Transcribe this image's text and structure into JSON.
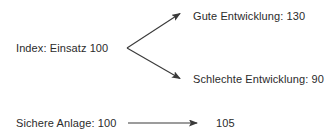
{
  "diagram": {
    "type": "branching-arrow-diagram",
    "background_color": "#ffffff",
    "text_color": "#2b2b2b",
    "stroke_color": "#3a3a3a",
    "nodes": {
      "start_index": {
        "label": "Index: Einsatz 100",
        "value": 100
      },
      "outcome_good": {
        "label": "Gute Entwicklung: 130",
        "value": 130
      },
      "outcome_bad": {
        "label": "Schlechte Entwicklung: 90",
        "value": 90
      },
      "start_safe": {
        "label": "Sichere Anlage: 100",
        "value": 100
      },
      "outcome_safe": {
        "label": "105",
        "value": 105
      }
    },
    "arrows": [
      {
        "name": "arrow-to-good",
        "from": [
          127,
          48
        ],
        "to": [
          182,
          12
        ]
      },
      {
        "name": "arrow-to-bad",
        "from": [
          127,
          48
        ],
        "to": [
          182,
          80
        ]
      },
      {
        "name": "arrow-safe",
        "from": [
          128,
          123
        ],
        "to": [
          200,
          123
        ]
      }
    ]
  }
}
